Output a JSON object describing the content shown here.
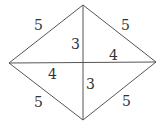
{
  "diagram": {
    "type": "rhombus with diagonals",
    "vertices": {
      "top": [
        83,
        5
      ],
      "left": [
        9,
        63
      ],
      "right": [
        156,
        62
      ],
      "bottom": [
        83,
        120
      ],
      "center": [
        83,
        62
      ]
    },
    "edge_labels": {
      "top_left": "5",
      "top_right": "5",
      "bottom_left": "5",
      "bottom_right": "5"
    },
    "diagonal_labels": {
      "upper_half": "3",
      "lower_half": "3",
      "left_half": "4",
      "right_half": "4"
    },
    "line_color": "#555555"
  }
}
